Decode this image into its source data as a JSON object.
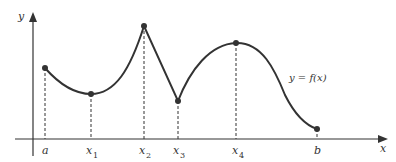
{
  "diagram": {
    "axes": {
      "y_label": "y",
      "x_label": "x"
    },
    "curve_label": "y = f(x)",
    "points": [
      {
        "name": "a",
        "label": "a",
        "sub": "",
        "x": 45,
        "y": 68
      },
      {
        "name": "x1",
        "label": "x",
        "sub": "1",
        "x": 91,
        "y": 94
      },
      {
        "name": "x2",
        "label": "x",
        "sub": "2",
        "x": 144,
        "y": 26
      },
      {
        "name": "x3",
        "label": "x",
        "sub": "3",
        "x": 178,
        "y": 101
      },
      {
        "name": "x4",
        "label": "x",
        "sub": "4",
        "x": 236,
        "y": 43
      },
      {
        "name": "b",
        "label": "b",
        "sub": "",
        "x": 317,
        "y": 129
      }
    ],
    "colors": {
      "line": "#333333",
      "background": "#ffffff"
    }
  }
}
